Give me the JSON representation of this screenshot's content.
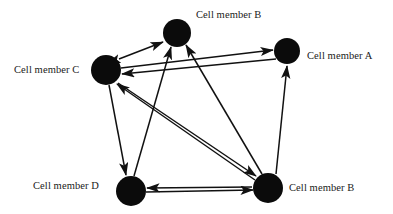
{
  "diagram": {
    "background_color": "#ffffff",
    "node_color": "#0b0b0b",
    "edge_color": "#111111",
    "nodes": [
      {
        "id": "B_top",
        "label": "Cell member B",
        "cx": 177,
        "cy": 33,
        "r": 14,
        "label_x": 196,
        "label_y": 9
      },
      {
        "id": "A",
        "label": "Cell member A",
        "cx": 287,
        "cy": 51,
        "r": 13,
        "label_x": 307,
        "label_y": 50
      },
      {
        "id": "C",
        "label": "Cell member C",
        "cx": 106,
        "cy": 70,
        "r": 15,
        "label_x": 14,
        "label_y": 64
      },
      {
        "id": "D",
        "label": "Cell member D",
        "cx": 131,
        "cy": 191,
        "r": 15,
        "label_x": 33,
        "label_y": 180
      },
      {
        "id": "B_bottom",
        "label": "Cell member B",
        "cx": 268,
        "cy": 188,
        "r": 15,
        "label_x": 289,
        "label_y": 182
      }
    ],
    "edges": [
      {
        "from": "C",
        "to": "B_top",
        "direction": "bidirectional"
      },
      {
        "from": "C",
        "to": "A",
        "direction": "directed"
      },
      {
        "from": "A",
        "to": "C",
        "direction": "directed"
      },
      {
        "from": "C",
        "to": "D",
        "direction": "directed"
      },
      {
        "from": "C",
        "to": "B_bottom",
        "direction": "directed"
      },
      {
        "from": "D",
        "to": "B_top",
        "direction": "directed"
      },
      {
        "from": "D",
        "to": "B_bottom",
        "direction": "directed"
      },
      {
        "from": "B_bottom",
        "to": "D",
        "direction": "directed"
      },
      {
        "from": "B_bottom",
        "to": "C",
        "direction": "directed"
      },
      {
        "from": "B_bottom",
        "to": "A",
        "direction": "directed"
      },
      {
        "from": "B_bottom",
        "to": "B_top",
        "direction": "directed"
      }
    ]
  }
}
